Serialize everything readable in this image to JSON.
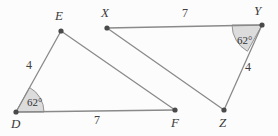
{
  "figure": {
    "background_color": "#fcfcfc",
    "stroke_color": "#8a8a8a",
    "vertex_color": "#4a4a4a",
    "angle_fill_color": "#dcdcdc",
    "width": 278,
    "height": 136
  },
  "vertices": [
    {
      "name": "D",
      "label": "D",
      "x": 16,
      "y": 112,
      "label_x": 11,
      "label_y": 117
    },
    {
      "name": "E",
      "label": "E",
      "x": 61,
      "y": 31,
      "label_x": 55,
      "label_y": 9
    },
    {
      "name": "F",
      "label": "F",
      "x": 175,
      "y": 110,
      "label_x": 171,
      "label_y": 116
    },
    {
      "name": "X",
      "label": "X",
      "x": 107,
      "y": 28,
      "label_x": 101,
      "label_y": 6
    },
    {
      "name": "Y",
      "label": "Y",
      "x": 262,
      "y": 25,
      "label_x": 254,
      "label_y": 4
    },
    {
      "name": "Z",
      "label": "Z",
      "x": 224,
      "y": 110,
      "label_x": 219,
      "label_y": 116
    }
  ],
  "segments": [
    {
      "name": "segment-DE",
      "from": "D",
      "to": "E"
    },
    {
      "name": "segment-DF",
      "from": "D",
      "to": "F"
    },
    {
      "name": "segment-EF",
      "from": "E",
      "to": "F"
    },
    {
      "name": "segment-XY",
      "from": "X",
      "to": "Y"
    },
    {
      "name": "segment-YZ",
      "from": "Y",
      "to": "Z"
    },
    {
      "name": "segment-XZ",
      "from": "X",
      "to": "Z"
    }
  ],
  "side_labels": [
    {
      "name": "side-DE-length",
      "text": "4",
      "x": 26,
      "y": 59
    },
    {
      "name": "side-DF-length",
      "text": "7",
      "x": 94,
      "y": 114
    },
    {
      "name": "side-XY-length",
      "text": "7",
      "x": 182,
      "y": 7
    },
    {
      "name": "side-YZ-length",
      "text": "4",
      "x": 245,
      "y": 61
    }
  ],
  "angle_marks": [
    {
      "name": "angle-D",
      "text": "62°",
      "vertex": "D",
      "label_x": 27,
      "label_y": 97,
      "radius": 28,
      "start_deg": 0,
      "end_deg": 61
    },
    {
      "name": "angle-Y",
      "text": "62°",
      "vertex": "Y",
      "label_x": 237,
      "label_y": 35,
      "radius": 30,
      "start_deg": 180,
      "end_deg": 241
    }
  ]
}
